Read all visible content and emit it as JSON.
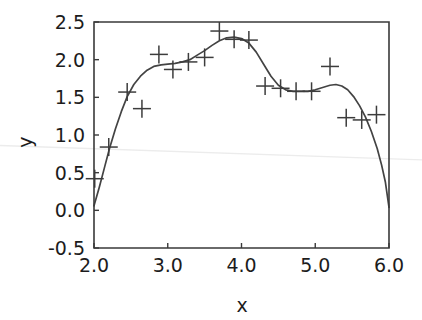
{
  "chart_data": {
    "type": "scatter",
    "title": "",
    "xlabel": "x",
    "ylabel": "y",
    "xlim": [
      2.0,
      6.0
    ],
    "ylim": [
      -0.5,
      2.5
    ],
    "xticks": [
      2.0,
      3.0,
      4.0,
      5.0,
      6.0
    ],
    "xtick_labels": [
      "2.0",
      "3.0",
      "4.0",
      "5.0",
      "6.0"
    ],
    "yticks": [
      -0.5,
      0.0,
      0.5,
      1.0,
      1.5,
      2.0,
      2.5
    ],
    "ytick_labels": [
      "-0.5",
      "0.0",
      "0.5",
      "1.0",
      "1.5",
      "2.0",
      "2.5"
    ],
    "grid": false,
    "legend": false,
    "marker_style": "plus",
    "series": [
      {
        "name": "observations",
        "type": "scatter",
        "marker": "plus",
        "points": [
          {
            "x": 2.01,
            "y": 0.42
          },
          {
            "x": 2.2,
            "y": 0.84
          },
          {
            "x": 2.45,
            "y": 1.57
          },
          {
            "x": 2.65,
            "y": 1.35
          },
          {
            "x": 2.88,
            "y": 2.07
          },
          {
            "x": 3.07,
            "y": 1.87
          },
          {
            "x": 3.28,
            "y": 1.97
          },
          {
            "x": 3.5,
            "y": 2.03
          },
          {
            "x": 3.7,
            "y": 2.38
          },
          {
            "x": 3.9,
            "y": 2.27
          },
          {
            "x": 4.1,
            "y": 2.26
          },
          {
            "x": 4.32,
            "y": 1.65
          },
          {
            "x": 4.53,
            "y": 1.62
          },
          {
            "x": 4.74,
            "y": 1.58
          },
          {
            "x": 4.95,
            "y": 1.58
          },
          {
            "x": 5.2,
            "y": 1.91
          },
          {
            "x": 5.42,
            "y": 1.23
          },
          {
            "x": 5.63,
            "y": 1.2
          },
          {
            "x": 5.83,
            "y": 1.27
          }
        ]
      },
      {
        "name": "fitted-curve",
        "type": "line",
        "points": [
          {
            "x": 2.0,
            "y": 0.06
          },
          {
            "x": 2.07,
            "y": 0.3
          },
          {
            "x": 2.14,
            "y": 0.56
          },
          {
            "x": 2.21,
            "y": 0.82
          },
          {
            "x": 2.29,
            "y": 1.08
          },
          {
            "x": 2.37,
            "y": 1.31
          },
          {
            "x": 2.45,
            "y": 1.51
          },
          {
            "x": 2.54,
            "y": 1.67
          },
          {
            "x": 2.63,
            "y": 1.78
          },
          {
            "x": 2.72,
            "y": 1.86
          },
          {
            "x": 2.81,
            "y": 1.91
          },
          {
            "x": 2.91,
            "y": 1.93
          },
          {
            "x": 3.0,
            "y": 1.94
          },
          {
            "x": 3.1,
            "y": 1.95
          },
          {
            "x": 3.2,
            "y": 1.97
          },
          {
            "x": 3.3,
            "y": 2.0
          },
          {
            "x": 3.4,
            "y": 2.06
          },
          {
            "x": 3.5,
            "y": 2.12
          },
          {
            "x": 3.6,
            "y": 2.19
          },
          {
            "x": 3.7,
            "y": 2.25
          },
          {
            "x": 3.8,
            "y": 2.29
          },
          {
            "x": 3.9,
            "y": 2.3
          },
          {
            "x": 4.0,
            "y": 2.28
          },
          {
            "x": 4.1,
            "y": 2.22
          },
          {
            "x": 4.2,
            "y": 2.1
          },
          {
            "x": 4.3,
            "y": 1.94
          },
          {
            "x": 4.4,
            "y": 1.78
          },
          {
            "x": 4.5,
            "y": 1.66
          },
          {
            "x": 4.6,
            "y": 1.6
          },
          {
            "x": 4.7,
            "y": 1.58
          },
          {
            "x": 4.8,
            "y": 1.58
          },
          {
            "x": 4.9,
            "y": 1.58
          },
          {
            "x": 5.0,
            "y": 1.6
          },
          {
            "x": 5.1,
            "y": 1.63
          },
          {
            "x": 5.2,
            "y": 1.66
          },
          {
            "x": 5.28,
            "y": 1.67
          },
          {
            "x": 5.36,
            "y": 1.65
          },
          {
            "x": 5.44,
            "y": 1.6
          },
          {
            "x": 5.52,
            "y": 1.51
          },
          {
            "x": 5.6,
            "y": 1.39
          },
          {
            "x": 5.68,
            "y": 1.24
          },
          {
            "x": 5.76,
            "y": 1.05
          },
          {
            "x": 5.84,
            "y": 0.82
          },
          {
            "x": 5.9,
            "y": 0.6
          },
          {
            "x": 5.95,
            "y": 0.38
          },
          {
            "x": 6.0,
            "y": 0.04
          }
        ]
      }
    ],
    "annotations": [
      {
        "name": "scan-artifact-line",
        "description": "faint horizontal scanning streak across full image",
        "y_left": 0.86,
        "y_right": 0.67
      }
    ]
  }
}
